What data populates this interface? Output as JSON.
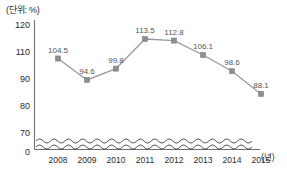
{
  "chart_data": {
    "type": "line",
    "title": "",
    "subtitle": "",
    "unit_label": "(단위: %)",
    "xlabel": "(년)",
    "ylabel": "",
    "categories": [
      "2008",
      "2009",
      "2010",
      "2011",
      "2012",
      "2013",
      "2014",
      "2015"
    ],
    "values": [
      104.5,
      94.6,
      99.8,
      113.5,
      112.8,
      106.1,
      98.6,
      88.1
    ],
    "data_labels": [
      "104.5",
      "94.6",
      "99.8",
      "113.5",
      "112.8",
      "106.1",
      "98.6",
      "88.1"
    ],
    "series": [
      {
        "name": "",
        "values": [
          104.5,
          94.6,
          99.8,
          113.5,
          112.8,
          106.1,
          98.6,
          88.1
        ]
      }
    ],
    "ytick_labels": [
      "120",
      "110",
      "90",
      "80",
      "70",
      "0"
    ],
    "ytick_values": [
      120,
      110,
      90,
      80,
      70,
      0
    ],
    "ylim": [
      70,
      120
    ],
    "axis_break": true,
    "axis_break_style": "wavy",
    "grid": false,
    "legend": "none",
    "marker_shape": "square",
    "colors": {
      "line": "#9a9a9e",
      "marker": "#8d8d92",
      "axis": "#6f6f72",
      "text": "#2b2b2b",
      "value_text": "#55555a",
      "background": "#ffffff"
    }
  },
  "axis": {
    "y_labels": [
      {
        "text": "120",
        "y": 25
      },
      {
        "text": "110",
        "y": 52
      },
      {
        "text": "90",
        "y": 79
      },
      {
        "text": "80",
        "y": 106
      },
      {
        "text": "70",
        "y": 133
      },
      {
        "text": "0",
        "y": 152
      }
    ],
    "x_labels": [
      {
        "text": "2008",
        "x": 58
      },
      {
        "text": "2009",
        "x": 87
      },
      {
        "text": "2010",
        "x": 116
      },
      {
        "text": "2011",
        "x": 145
      },
      {
        "text": "2012",
        "x": 174
      },
      {
        "text": "2013",
        "x": 203
      },
      {
        "text": "2014",
        "x": 232
      },
      {
        "text": "2015",
        "x": 261
      }
    ]
  }
}
